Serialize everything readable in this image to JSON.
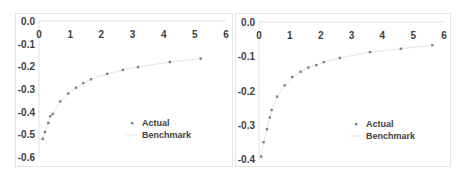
{
  "chart_data": [
    {
      "type": "scatter",
      "title": "",
      "xlabel": "",
      "ylabel": "",
      "xlim": [
        0,
        6
      ],
      "ylim": [
        -0.6,
        0.0
      ],
      "xticks": [
        "0",
        "1",
        "2",
        "3",
        "4",
        "5",
        "6"
      ],
      "yticks": [
        "0.0",
        "-0.1",
        "-0.2",
        "-0.3",
        "-0.4",
        "-0.5",
        "-0.6"
      ],
      "x_axis_position": "top",
      "grid": false,
      "legend_position": "lower right",
      "legend": [
        "Actual",
        "Benchmark"
      ],
      "series": [
        {
          "name": "Actual",
          "style": "markers",
          "x": [
            0.12,
            0.19,
            0.3,
            0.36,
            0.44,
            0.68,
            0.94,
            1.19,
            1.42,
            1.67,
            2.19,
            2.69,
            3.18,
            4.2,
            5.19
          ],
          "y": [
            -0.52,
            -0.49,
            -0.45,
            -0.42,
            -0.41,
            -0.355,
            -0.32,
            -0.294,
            -0.274,
            -0.257,
            -0.233,
            -0.216,
            -0.203,
            -0.181,
            -0.166
          ]
        },
        {
          "name": "Benchmark",
          "style": "line",
          "x": [
            0.12,
            0.19,
            0.3,
            0.36,
            0.44,
            0.68,
            0.94,
            1.19,
            1.42,
            1.67,
            2.19,
            2.69,
            3.18,
            4.2,
            5.19
          ],
          "y": [
            -0.52,
            -0.49,
            -0.45,
            -0.42,
            -0.41,
            -0.355,
            -0.32,
            -0.294,
            -0.274,
            -0.257,
            -0.233,
            -0.216,
            -0.203,
            -0.181,
            -0.166
          ]
        }
      ]
    },
    {
      "type": "scatter",
      "title": "",
      "xlabel": "",
      "ylabel": "",
      "xlim": [
        0,
        6
      ],
      "ylim": [
        -0.4,
        0.0
      ],
      "xticks": [
        "0",
        "1",
        "2",
        "3",
        "4",
        "5",
        "6"
      ],
      "yticks": [
        "0.0",
        "-0.1",
        "-0.2",
        "-0.3",
        "-0.4"
      ],
      "x_axis_position": "top",
      "grid": false,
      "legend_position": "lower right",
      "legend": [
        "Actual",
        "Benchmark"
      ],
      "series": [
        {
          "name": "Actual",
          "style": "markers",
          "x": [
            0.07,
            0.15,
            0.26,
            0.35,
            0.41,
            0.59,
            0.83,
            1.08,
            1.35,
            1.6,
            1.86,
            2.1,
            2.62,
            3.6,
            4.6,
            5.62
          ],
          "y": [
            -0.393,
            -0.351,
            -0.313,
            -0.279,
            -0.257,
            -0.218,
            -0.185,
            -0.161,
            -0.145,
            -0.133,
            -0.126,
            -0.117,
            -0.105,
            -0.088,
            -0.078,
            -0.068
          ]
        },
        {
          "name": "Benchmark",
          "style": "line",
          "x": [
            0.07,
            0.15,
            0.26,
            0.35,
            0.41,
            0.59,
            0.83,
            1.08,
            1.35,
            1.6,
            1.86,
            2.1,
            2.62,
            3.6,
            4.6,
            5.62
          ],
          "y": [
            -0.393,
            -0.351,
            -0.313,
            -0.279,
            -0.257,
            -0.218,
            -0.185,
            -0.161,
            -0.145,
            -0.133,
            -0.126,
            -0.117,
            -0.105,
            -0.088,
            -0.078,
            -0.068
          ]
        }
      ]
    }
  ],
  "colors": {
    "marker": "#7f7f7f",
    "benchmark_line": "#e6e6e6",
    "axis": "#e2e2e2",
    "text": "#404040"
  }
}
